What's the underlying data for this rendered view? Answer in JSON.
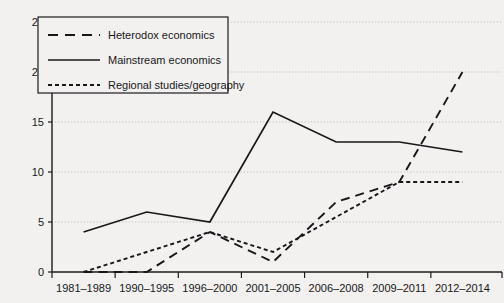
{
  "chart_data": {
    "type": "line",
    "title": "",
    "subtitle": "",
    "xlabel": "",
    "ylabel": "",
    "categories": [
      "1981–1989",
      "1990–1995",
      "1996–2000",
      "2001–2005",
      "2006–2008",
      "2009–2011",
      "2012–2014"
    ],
    "ylim": [
      0,
      25
    ],
    "yticks": [
      0,
      5,
      10,
      15,
      20,
      25
    ],
    "ytick_labels": [
      "0",
      "5",
      "10",
      "15",
      "20",
      "25"
    ],
    "grid": "horizontal-dotted",
    "legend_position": "upper-left",
    "series": [
      {
        "name": "Heterodox economics",
        "style": "long-dash",
        "values": [
          0,
          0,
          4,
          1,
          7,
          9,
          20
        ]
      },
      {
        "name": "Mainstream economics",
        "style": "solid",
        "values": [
          4,
          6,
          5,
          16,
          13,
          13,
          12
        ]
      },
      {
        "name": "Regional studies/geography",
        "style": "short-dash",
        "values": [
          0,
          2,
          4,
          2,
          5.5,
          9,
          9
        ]
      }
    ]
  },
  "legend": {
    "items": [
      {
        "label": "Heterodox economics",
        "style": "long-dash"
      },
      {
        "label": "Mainstream economics",
        "style": "solid"
      },
      {
        "label": "Regional studies/geography",
        "style": "short-dash"
      }
    ]
  },
  "colors": {
    "background": "#f2f1ef",
    "ink": "#17171a",
    "grid": "#b9b7b4"
  }
}
